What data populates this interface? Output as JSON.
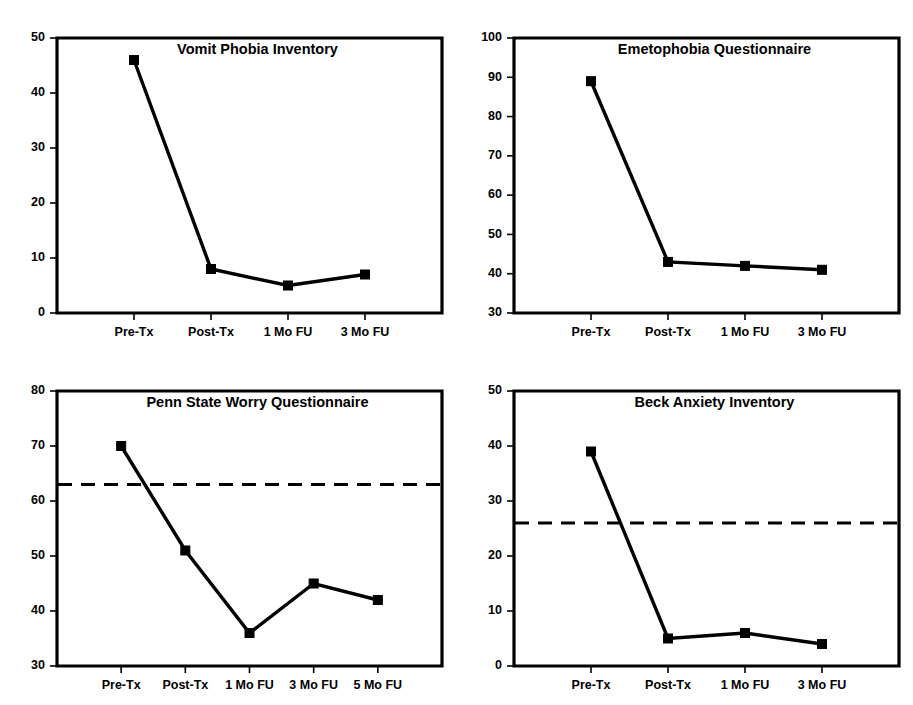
{
  "figure": {
    "background_color": "#ffffff",
    "ink_color": "#000000",
    "panel_count": 4
  },
  "chart_data": [
    {
      "id": "vpi",
      "type": "line",
      "title": "Vomit Phobia Inventory",
      "xlabel": "",
      "ylabel": "",
      "categories": [
        "Pre-Tx",
        "Post-Tx",
        "1 Mo FU",
        "3 Mo FU"
      ],
      "values": [
        46,
        8,
        5,
        7
      ],
      "ylim": [
        0,
        50
      ],
      "yticks": [
        0,
        10,
        20,
        30,
        40,
        50
      ],
      "ytick_labels": [
        "0",
        "10",
        "20",
        "30",
        "40",
        "50"
      ],
      "grid": false,
      "legend": "none",
      "marker": "square",
      "reference_line": null
    },
    {
      "id": "eq",
      "type": "line",
      "title": "Emetophobia Questionnaire",
      "xlabel": "",
      "ylabel": "",
      "categories": [
        "Pre-Tx",
        "Post-Tx",
        "1 Mo FU",
        "3 Mo FU"
      ],
      "values": [
        89,
        43,
        42,
        41
      ],
      "ylim": [
        30,
        100
      ],
      "yticks": [
        30,
        40,
        50,
        60,
        70,
        80,
        90,
        100
      ],
      "ytick_labels": [
        "30",
        "40",
        "50",
        "60",
        "70",
        "80",
        "90",
        "100"
      ],
      "grid": false,
      "legend": "none",
      "marker": "square",
      "reference_line": null
    },
    {
      "id": "pswq",
      "type": "line",
      "title": "Penn State Worry Questionnaire",
      "xlabel": "",
      "ylabel": "",
      "categories": [
        "Pre-Tx",
        "Post-Tx",
        "1 Mo FU",
        "3 Mo FU",
        "5 Mo FU"
      ],
      "values": [
        70,
        51,
        36,
        45,
        42
      ],
      "ylim": [
        30,
        80
      ],
      "yticks": [
        30,
        40,
        50,
        60,
        70,
        80
      ],
      "ytick_labels": [
        "30",
        "40",
        "50",
        "60",
        "70",
        "80"
      ],
      "grid": false,
      "legend": "none",
      "marker": "square",
      "reference_line": 63
    },
    {
      "id": "bai",
      "type": "line",
      "title": "Beck Anxiety Inventory",
      "xlabel": "",
      "ylabel": "",
      "categories": [
        "Pre-Tx",
        "Post-Tx",
        "1 Mo FU",
        "3 Mo FU"
      ],
      "values": [
        39,
        5,
        6,
        4
      ],
      "ylim": [
        0,
        50
      ],
      "yticks": [
        0,
        10,
        20,
        30,
        40,
        50
      ],
      "ytick_labels": [
        "0",
        "10",
        "20",
        "30",
        "40",
        "50"
      ],
      "grid": false,
      "legend": "none",
      "marker": "square",
      "reference_line": 26
    }
  ]
}
